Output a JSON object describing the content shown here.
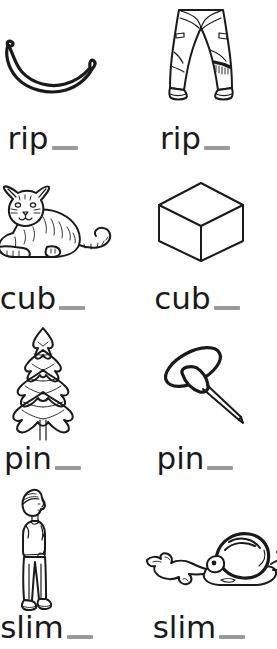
{
  "worksheet": {
    "title": "rip cub pin slim word building worksheet",
    "blank_color": "#9a9a9a",
    "ink_color": "#1a1a1a",
    "background_color": "#ffffff",
    "columns": 2,
    "rows": 4
  },
  "items": [
    {
      "id": "item-rip-banana",
      "word": "rip",
      "blank": "_",
      "row": 1,
      "column": 1,
      "picture_name": "banana-illustration",
      "picture_label": "banana",
      "answer_word": "ripe"
    },
    {
      "id": "item-rip-jeans",
      "word": "rip",
      "blank": "_",
      "row": 1,
      "column": 2,
      "picture_name": "ripped-jeans-illustration",
      "picture_label": "ripped jeans",
      "answer_word": "ripped"
    },
    {
      "id": "item-cub-tiger",
      "word": "cub",
      "blank": "_",
      "row": 2,
      "column": 1,
      "picture_name": "tiger-cub-illustration",
      "picture_label": "tiger cub",
      "answer_word": "cub"
    },
    {
      "id": "item-cub-cube",
      "word": "cub",
      "blank": "_",
      "row": 2,
      "column": 2,
      "picture_name": "cube-illustration",
      "picture_label": "cube",
      "answer_word": "cube"
    },
    {
      "id": "item-pin-tree",
      "word": "pin",
      "blank": "_",
      "row": 3,
      "column": 1,
      "picture_name": "pine-tree-illustration",
      "picture_label": "pine tree",
      "answer_word": "pine"
    },
    {
      "id": "item-pin-pushpin",
      "word": "pin",
      "blank": "_",
      "row": 3,
      "column": 2,
      "picture_name": "push-pin-illustration",
      "picture_label": "push pin",
      "answer_word": "pin"
    },
    {
      "id": "item-slim-person",
      "word": "slim",
      "blank": "_",
      "row": 4,
      "column": 1,
      "picture_name": "slim-person-illustration",
      "picture_label": "slim person",
      "answer_word": "slim"
    },
    {
      "id": "item-slim-snail",
      "word": "slim",
      "blank": "_",
      "row": 4,
      "column": 2,
      "picture_name": "snail-slime-illustration",
      "picture_label": "snail leaving slime trail",
      "answer_word": "slime"
    }
  ]
}
